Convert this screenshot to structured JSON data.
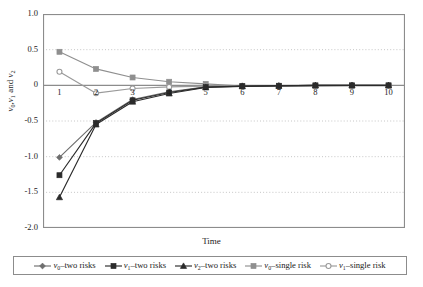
{
  "chart_data": {
    "type": "line",
    "title": "",
    "xlabel": "Time",
    "ylabel": "v0,v1 and v2",
    "ylabel_parts": [
      {
        "v": "v",
        "sub": "0"
      },
      {
        "lit": ","
      },
      {
        "v": "v",
        "sub": "1"
      },
      {
        "lit": " and "
      },
      {
        "v": "v",
        "sub": "2"
      }
    ],
    "x": [
      1,
      2,
      3,
      4,
      5,
      6,
      7,
      8,
      9,
      10
    ],
    "xtick_labels": [
      "1",
      "2",
      "3",
      "4",
      "5",
      "6",
      "7",
      "8",
      "9",
      "10"
    ],
    "ytick_labels": [
      "1.0",
      "0.5",
      "0",
      "-0.5",
      "-1.0",
      "-1.5",
      "-2.0"
    ],
    "ytick_values": [
      1.0,
      0.5,
      0,
      -0.5,
      -1.0,
      -1.5,
      -2.0
    ],
    "xlim": [
      0.55,
      10.45
    ],
    "ylim": [
      -2.0,
      1.0
    ],
    "grid": "horizontal-dotted",
    "zero_line": true,
    "legend_position": "bottom",
    "series": [
      {
        "name": "v0-two risks",
        "label_parts": [
          {
            "v": "v",
            "sub": "0"
          },
          {
            "lit": "–two risks"
          }
        ],
        "marker": "diamond",
        "color": "#6e6e6e",
        "line_color": "#6e6e6e",
        "values": [
          -1.01,
          -0.52,
          -0.2,
          -0.09,
          -0.02,
          -0.01,
          -0.005,
          0.0,
          0.0,
          0.0
        ]
      },
      {
        "name": "v1-two risks",
        "label_parts": [
          {
            "v": "v",
            "sub": "1"
          },
          {
            "lit": "–two risks"
          }
        ],
        "marker": "square",
        "color": "#2b2b2b",
        "line_color": "#2b2b2b",
        "values": [
          -1.26,
          -0.53,
          -0.21,
          -0.1,
          -0.025,
          -0.012,
          -0.006,
          0.0,
          0.0,
          0.0
        ]
      },
      {
        "name": "v2-two risks",
        "label_parts": [
          {
            "v": "v",
            "sub": "2"
          },
          {
            "lit": "–two risks"
          }
        ],
        "marker": "triangle",
        "color": "#2b2b2b",
        "line_color": "#2b2b2b",
        "values": [
          -1.57,
          -0.55,
          -0.23,
          -0.115,
          -0.03,
          -0.014,
          -0.007,
          0.0,
          0.0,
          0.0
        ]
      },
      {
        "name": "v0-single risk",
        "label_parts": [
          {
            "v": "v",
            "sub": "0"
          },
          {
            "lit": "–single risk"
          }
        ],
        "marker": "square",
        "color": "#8f8f8f",
        "line_color": "#8f8f8f",
        "values": [
          0.47,
          0.23,
          0.11,
          0.05,
          0.02,
          -0.01,
          -0.012,
          -0.01,
          -0.005,
          -0.004
        ]
      },
      {
        "name": "v1-single risk",
        "label_parts": [
          {
            "v": "v",
            "sub": "1"
          },
          {
            "lit": "–single risk"
          }
        ],
        "marker": "circle",
        "color": "#9a9a9a",
        "line_color": "#9a9a9a",
        "values": [
          0.19,
          -0.11,
          -0.045,
          -0.022,
          -0.012,
          -0.008,
          -0.006,
          -0.005,
          -0.004,
          -0.004
        ]
      }
    ],
    "colors": {
      "frame": "#8c8c8c",
      "grid": "#c0c0c0",
      "zero_line": "#8c8c8c",
      "text": "#1a1a1a",
      "background": "#ffffff"
    }
  }
}
